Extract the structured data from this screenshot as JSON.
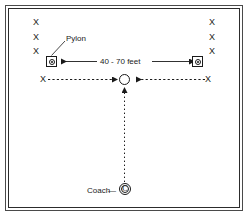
{
  "diagram": {
    "colors": {
      "ink": "#1a1a1a",
      "frame": "#2c2c2c",
      "frame_outer": "#4a4a4a",
      "background": "#ffffff"
    },
    "labels": {
      "pylon": "Pylon",
      "distance": "40 - 70 feet",
      "coach": "Coach",
      "coach_dash": "—",
      "coach_token": "C"
    },
    "players": {
      "glyph": "X",
      "left_column": [
        "X",
        "X",
        "X"
      ],
      "right_column": [
        "X",
        "X",
        "X"
      ],
      "left_runner": "X",
      "right_runner": "X"
    },
    "markers": {
      "pylon_left": "pylon",
      "pylon_right": "pylon",
      "ball": "ball",
      "coach": "coach"
    }
  }
}
